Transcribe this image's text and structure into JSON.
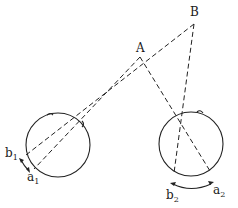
{
  "diagram": {
    "type": "binocular disparity / retinal correspondence",
    "points": {
      "A": {
        "label": "A"
      },
      "B": {
        "label": "B"
      }
    },
    "left_eye": {
      "label_b": "b",
      "label_b_sub": "1",
      "label_a": "a",
      "label_a_sub": "1"
    },
    "right_eye": {
      "label_b": "b",
      "label_b_sub": "2",
      "label_a": "a",
      "label_a_sub": "2"
    },
    "colors": {
      "line": "#222222",
      "background": "#ffffff"
    }
  }
}
